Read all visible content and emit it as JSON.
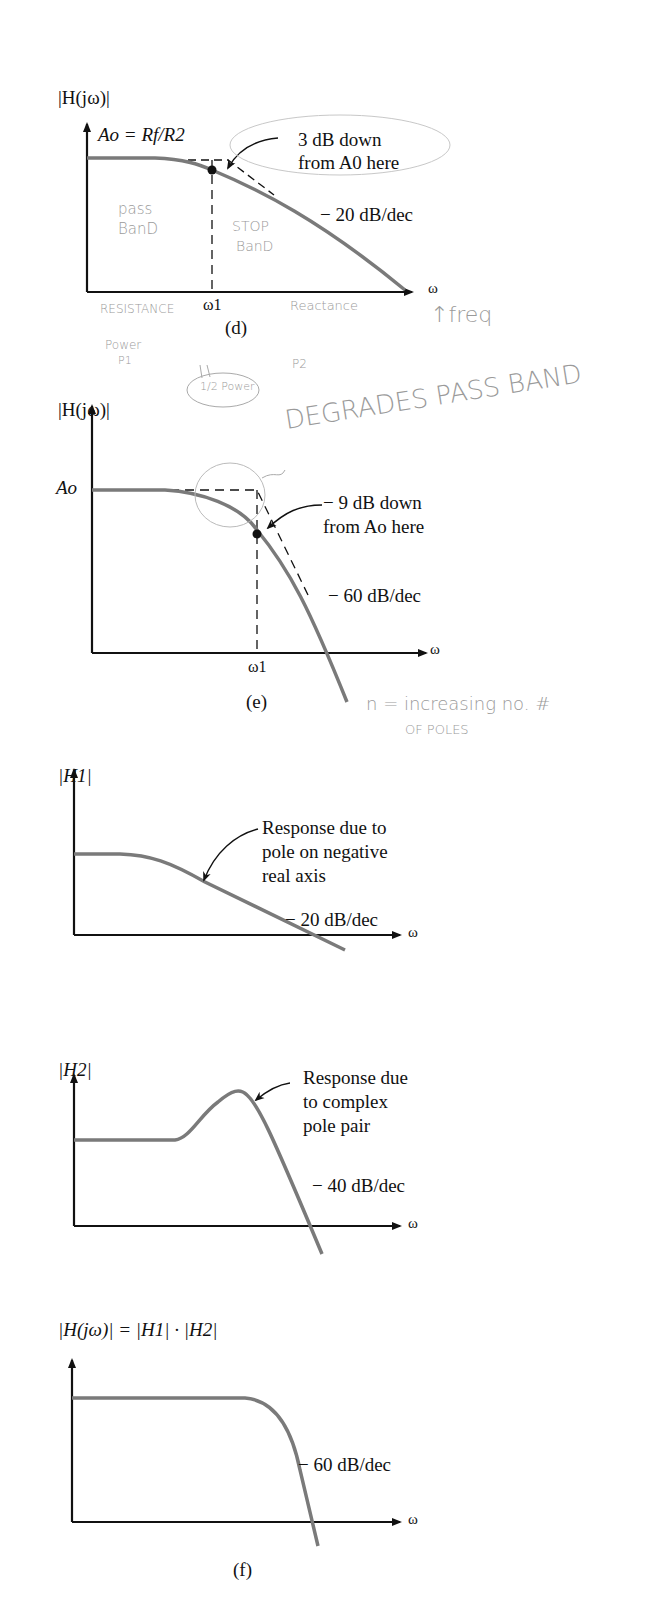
{
  "figure": {
    "panels": [
      {
        "id": "d",
        "caption": "(d)",
        "ylabel": "|H(jω)|",
        "xlabel": "ω",
        "tick": "ω1",
        "gain_label": "Ao = Rf/R2",
        "annotation": [
          "3 dB down",
          "from A0 here"
        ],
        "slope_label": "− 20 dB/dec",
        "handwritten": [
          "pass",
          "BanD",
          "STOP",
          "BanD",
          "RESISTANCE",
          "Reactance",
          "↑freq",
          "Power",
          "P1",
          "1/2 Power",
          "P2"
        ]
      },
      {
        "id": "e",
        "caption": "(e)",
        "ylabel": "|H(jω)|",
        "xlabel": "ω",
        "tick": "ω1",
        "gain_label": "Ao",
        "annotation": [
          "− 9 dB down",
          "from Ao here"
        ],
        "slope_label": "− 60 dB/dec",
        "handwritten": [
          "DEGRADES PASS BAND",
          "n = increasing no. #",
          "OF POLES"
        ]
      },
      {
        "id": "h1",
        "ylabel": "|H1|",
        "xlabel": "ω",
        "annotation": [
          "Response due to",
          "pole on negative",
          "real axis"
        ],
        "slope_label": "− 20 dB/dec"
      },
      {
        "id": "h2",
        "ylabel": "|H2|",
        "xlabel": "ω",
        "annotation": [
          "Response due",
          "to complex",
          "pole pair"
        ],
        "slope_label": "− 40 dB/dec"
      },
      {
        "id": "f",
        "caption": "(f)",
        "ylabel": "|H(jω)| = |H1| · |H2|",
        "xlabel": "ω",
        "slope_label": "− 60 dB/dec"
      }
    ],
    "colors": {
      "curve": "#7a7a7a",
      "axis": "#111111",
      "handwriting": "#9a9a9a"
    }
  }
}
